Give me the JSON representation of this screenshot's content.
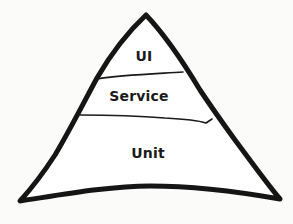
{
  "diagram": {
    "type": "pyramid",
    "layers": [
      {
        "label": "UI",
        "position": "top"
      },
      {
        "label": "Service",
        "position": "middle"
      },
      {
        "label": "Unit",
        "position": "bottom"
      }
    ],
    "colors": {
      "stroke": "#151515",
      "fill": "#ffffff",
      "background": "#fbfbfa",
      "text": "#1a1a1a"
    }
  }
}
